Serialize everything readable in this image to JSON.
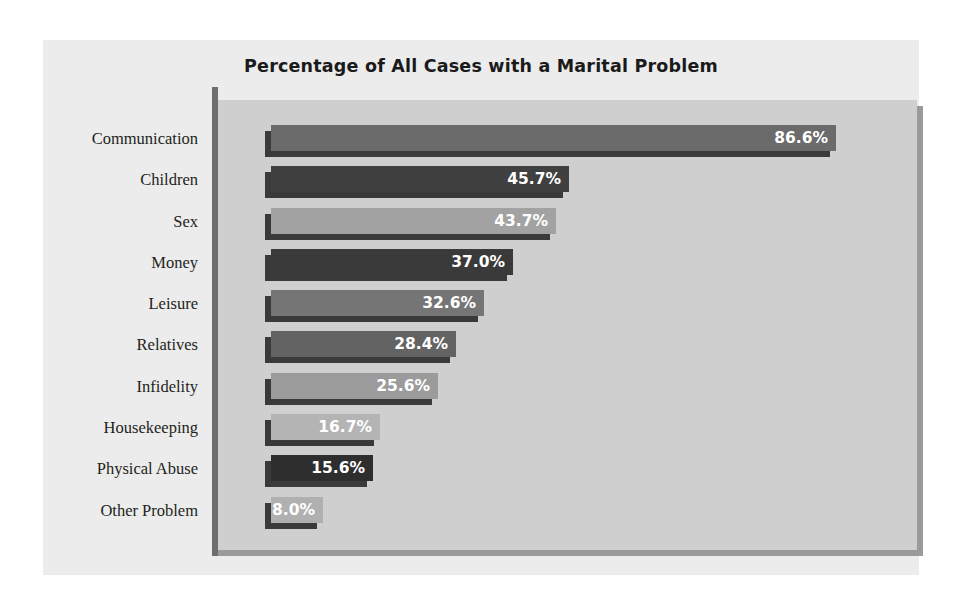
{
  "chart_data": {
    "type": "bar",
    "orientation": "horizontal",
    "title": "Percentage of All Cases with a Marital Problem",
    "xlabel": "",
    "ylabel": "",
    "xlim": [
      0,
      100
    ],
    "grid": false,
    "legend": "none",
    "categories": [
      "Communication",
      "Children",
      "Sex",
      "Money",
      "Leisure",
      "Relatives",
      "Infidelity",
      "Housekeeping",
      "Physical Abuse",
      "Other Problem"
    ],
    "values": [
      86.6,
      45.7,
      43.7,
      37.0,
      32.6,
      28.4,
      25.6,
      16.7,
      15.6,
      8.0
    ],
    "data_labels": [
      "86.6%",
      "45.7%",
      "43.7%",
      "37.0%",
      "32.6%",
      "28.4%",
      "25.6%",
      "16.7%",
      "15.6%",
      "8.0%"
    ],
    "bar_colors": [
      "#6b6b6b",
      "#404040",
      "#a2a2a2",
      "#3a3a3a",
      "#757575",
      "#636363",
      "#9b9b9b",
      "#b4b4b4",
      "#2e2e2e",
      "#b0b0b0"
    ],
    "colors": {
      "panel_background": "#ececec",
      "plot_background": "#cfcfcf",
      "plot_shadow": "#9a9a9a",
      "axis_line": "#6e6e6e",
      "bar_shadow": "#3a3a3a",
      "title_text": "#1a1a1a",
      "category_text": "#231f20",
      "value_label_text": "#ffffff"
    }
  }
}
